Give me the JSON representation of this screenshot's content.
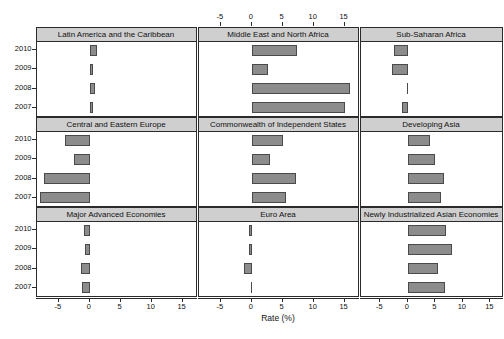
{
  "figure": {
    "xlabel": "Rate (%)",
    "ticks": [
      -5,
      0,
      5,
      10,
      15
    ],
    "tick_labels": [
      "-5",
      "0",
      "5",
      "10",
      "15"
    ],
    "years": [
      "2010",
      "2009",
      "2008",
      "2007"
    ],
    "xlim": [
      -8.6,
      17.4
    ],
    "bar_color": "#8c8c8c",
    "bar_edge_color": "#4a4a4a",
    "strip_color": "#cfcfcf",
    "frame_color": "#2b2b2b"
  },
  "chart_data": {
    "type": "bar",
    "title": "",
    "xlabel": "Rate (%)",
    "ylabel": "",
    "xlim": [
      -8.6,
      17.4
    ],
    "grid": false,
    "legend": "none",
    "orientation": "horizontal",
    "layout": "3x3 lattice of panels, bars grouped by year",
    "categories": [
      "2010",
      "2009",
      "2008",
      "2007"
    ],
    "panels": [
      {
        "name": "Latin America and the Caribbean",
        "row": 0,
        "col": 0,
        "values": [
          1.2,
          0.6,
          0.9,
          0.6
        ]
      },
      {
        "name": "Middle East and North Africa",
        "row": 0,
        "col": 1,
        "values": [
          7.3,
          2.6,
          15.8,
          15.1
        ]
      },
      {
        "name": "Sub-Saharan Africa",
        "row": 0,
        "col": 2,
        "values": [
          -2.6,
          -2.8,
          -0.1,
          -1.1
        ]
      },
      {
        "name": "Central and Eastern Europe",
        "row": 1,
        "col": 0,
        "values": [
          -4.0,
          -2.5,
          -7.4,
          -8.0
        ]
      },
      {
        "name": "Commonwealth of Independent States",
        "row": 1,
        "col": 1,
        "values": [
          5.0,
          3.0,
          7.1,
          5.6
        ]
      },
      {
        "name": "Developing Asia",
        "row": 1,
        "col": 2,
        "values": [
          4.0,
          5.0,
          6.6,
          6.0
        ]
      },
      {
        "name": "Major Advanced Economies",
        "row": 2,
        "col": 0,
        "values": [
          -1.0,
          -0.8,
          -1.4,
          -1.2
        ]
      },
      {
        "name": "Euro Area",
        "row": 2,
        "col": 1,
        "values": [
          -0.5,
          -0.5,
          -1.2,
          -0.1
        ]
      },
      {
        "name": "Newly Industrialized Asian Economies",
        "row": 2,
        "col": 2,
        "values": [
          7.0,
          8.0,
          5.5,
          6.7
        ]
      }
    ]
  }
}
